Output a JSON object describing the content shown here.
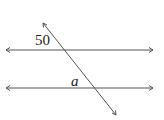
{
  "diagram": {
    "colors": {
      "line": "#555555",
      "text": "#222222",
      "background": "#ffffff"
    },
    "lines": [
      {
        "id": "parallel-top",
        "type": "double-arrow",
        "x1": 6,
        "y1": 50,
        "x2": 153,
        "y2": 50
      },
      {
        "id": "parallel-bottom",
        "type": "double-arrow",
        "x1": 6,
        "y1": 88,
        "x2": 153,
        "y2": 88
      },
      {
        "id": "transversal",
        "type": "double-arrow",
        "x1": 43,
        "y1": 23,
        "x2": 116,
        "y2": 115
      }
    ],
    "labels": {
      "angle_known": "50",
      "angle_unknown": "a"
    }
  }
}
